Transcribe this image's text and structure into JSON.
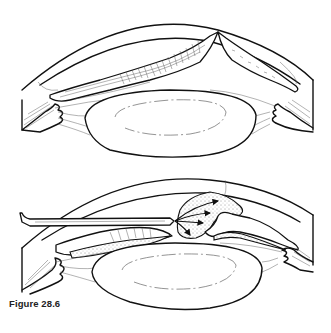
{
  "figure": {
    "caption": "Figure 28.6",
    "panels": [
      {
        "id": "top",
        "description": "Cross-section of anterior eye: cornea, iris with peaked pupillary margin, lens, ciliary body and zonules"
      },
      {
        "id": "bottom",
        "description": "Cross-section of anterior eye with surgical blade inserted through the anterior chamber; stippled material with arrows showing displacement over the iris"
      }
    ],
    "colors": {
      "line": "#111111",
      "background": "#ffffff",
      "caption": "#222222"
    }
  }
}
